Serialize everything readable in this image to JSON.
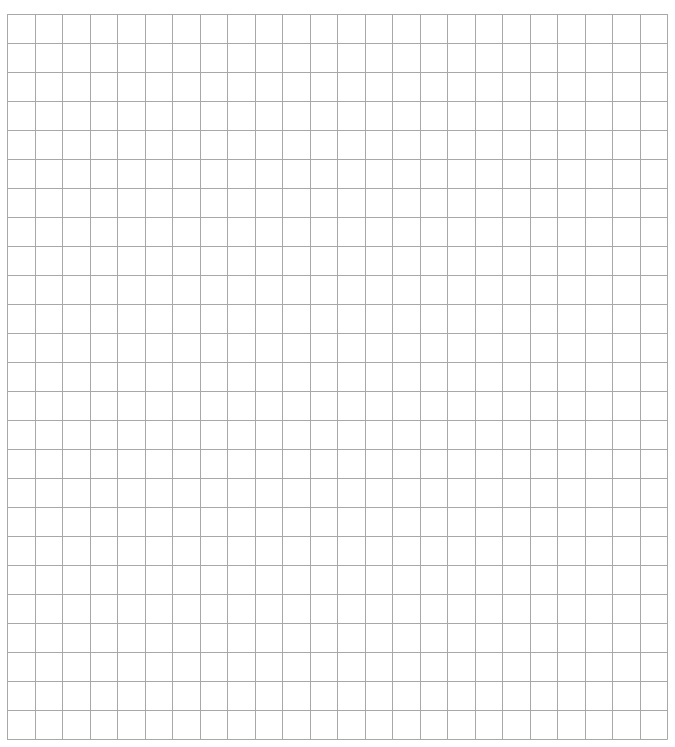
{
  "grid": {
    "columns": 24,
    "rows": 25,
    "left": 7,
    "top": 14,
    "width": 660,
    "height": 725,
    "line_color": "#a8a8a8",
    "background_color": "#ffffff"
  }
}
